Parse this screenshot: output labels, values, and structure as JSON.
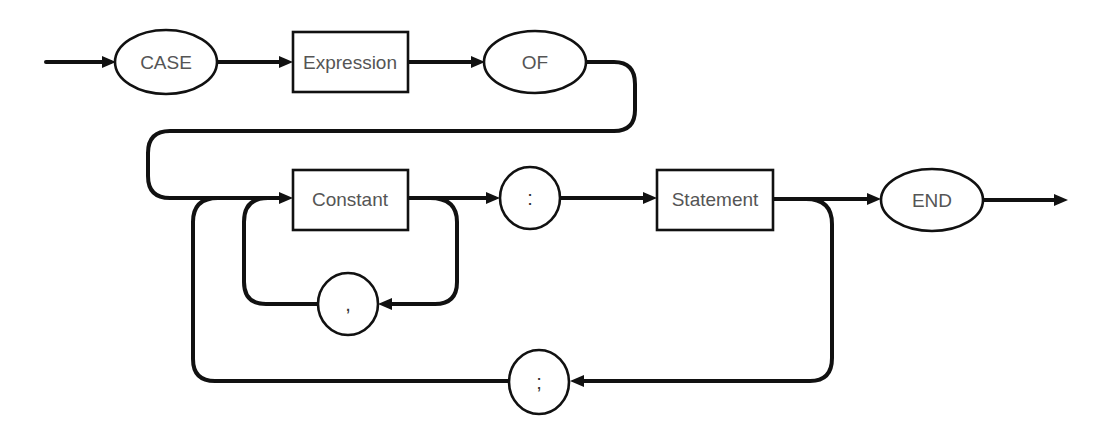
{
  "diagram": {
    "type": "syntax-diagram",
    "nodes": {
      "case": {
        "kind": "terminal",
        "shape": "ellipse",
        "label": "CASE"
      },
      "expression": {
        "kind": "non-terminal",
        "shape": "rectangle",
        "label": "Expression"
      },
      "of": {
        "kind": "terminal",
        "shape": "ellipse",
        "label": "OF"
      },
      "constant": {
        "kind": "non-terminal",
        "shape": "rectangle",
        "label": "Constant"
      },
      "comma": {
        "kind": "terminal",
        "shape": "circle",
        "label": ","
      },
      "colon": {
        "kind": "terminal",
        "shape": "circle",
        "label": ":"
      },
      "statement": {
        "kind": "non-terminal",
        "shape": "rectangle",
        "label": "Statement"
      },
      "semicolon": {
        "kind": "terminal",
        "shape": "circle",
        "label": ";"
      },
      "end": {
        "kind": "terminal",
        "shape": "ellipse",
        "label": "END"
      }
    },
    "edges": [
      {
        "from": "entry",
        "to": "case"
      },
      {
        "from": "case",
        "to": "expression"
      },
      {
        "from": "expression",
        "to": "of"
      },
      {
        "from": "of",
        "to": "constant"
      },
      {
        "from": "constant",
        "to": "colon"
      },
      {
        "from": "constant",
        "to": "comma",
        "note": "repeat loop"
      },
      {
        "from": "comma",
        "to": "constant"
      },
      {
        "from": "colon",
        "to": "statement"
      },
      {
        "from": "statement",
        "to": "end"
      },
      {
        "from": "statement",
        "to": "semicolon",
        "note": "repeat loop"
      },
      {
        "from": "semicolon",
        "to": "constant"
      },
      {
        "from": "end",
        "to": "exit"
      }
    ]
  }
}
